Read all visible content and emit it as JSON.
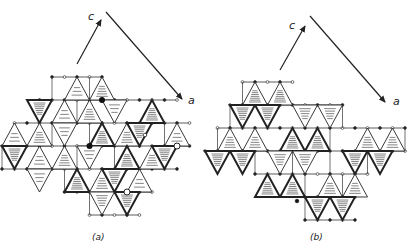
{
  "figure": {
    "panels": [
      {
        "id": "a",
        "caption": "(a)",
        "caption_pos": [
          92,
          240
        ],
        "axes": {
          "c": {
            "label": "c",
            "from": [
              77,
              64
            ],
            "to": [
              101,
              20
            ],
            "label_pos": [
              88,
              20
            ]
          },
          "a": {
            "label": "a",
            "from": [
              106,
              12
            ],
            "to": [
              182,
              99
            ],
            "label_pos": [
              188,
              104
            ]
          }
        },
        "origin": [
          52,
          77
        ],
        "dx": 12.5,
        "dy": 23,
        "triangles": [
          [
            2,
            0,
            "up",
            "light",
            false
          ],
          [
            4,
            0,
            "up",
            "stripe",
            false
          ],
          [
            -1,
            1,
            "down",
            "dense",
            true
          ],
          [
            1,
            1,
            "up",
            "light",
            false
          ],
          [
            3,
            1,
            "up",
            "stripe",
            false
          ],
          [
            5,
            1,
            "down",
            "light",
            false
          ],
          [
            8,
            1,
            "up",
            "dense",
            true
          ],
          [
            -3,
            2,
            "up",
            "light",
            false
          ],
          [
            -1,
            2,
            "up",
            "stripe",
            false
          ],
          [
            1,
            2,
            "down",
            "light",
            false
          ],
          [
            4,
            2,
            "up",
            "dense",
            true
          ],
          [
            6,
            2,
            "up",
            "stripe",
            false
          ],
          [
            7,
            2,
            "down",
            "dense",
            true
          ],
          [
            10,
            2,
            "up",
            "light",
            false
          ],
          [
            -3,
            3,
            "down",
            "dense",
            true
          ],
          [
            -1,
            3,
            "up",
            "light",
            false
          ],
          [
            1,
            3,
            "up",
            "stripe",
            false
          ],
          [
            3,
            3,
            "down",
            "light",
            false
          ],
          [
            6,
            3,
            "up",
            "dense",
            true
          ],
          [
            8,
            3,
            "up",
            "stripe",
            false
          ],
          [
            9,
            3,
            "down",
            "dense",
            true
          ],
          [
            -1,
            4,
            "down",
            "light",
            false
          ],
          [
            2,
            4,
            "up",
            "dense",
            true
          ],
          [
            4,
            4,
            "up",
            "stripe",
            false
          ],
          [
            5,
            4,
            "down",
            "dense",
            true
          ],
          [
            7,
            4,
            "up",
            "light",
            false
          ],
          [
            4,
            5,
            "down",
            "stripe",
            false
          ],
          [
            6,
            5,
            "down",
            "dense",
            true
          ]
        ],
        "rect_rows": [
          {
            "row": 0,
            "x0": 0,
            "x1": 4
          },
          {
            "row": 1,
            "x0": -1,
            "x1": 10
          },
          {
            "row": 2,
            "x0": -3,
            "x1": 11
          },
          {
            "row": 3,
            "x0": -4,
            "x1": 11
          },
          {
            "row": 4,
            "x0": -4,
            "x1": 10
          },
          {
            "row": 5,
            "x0": 1,
            "x1": 8
          },
          {
            "row": 6,
            "x0": 3,
            "x1": 7
          }
        ],
        "big_nodes": [
          [
            4,
            1
          ],
          [
            3,
            3
          ],
          [
            10,
            3
          ]
        ],
        "open_big_nodes": [
          [
            10,
            3
          ],
          [
            6,
            5
          ]
        ]
      },
      {
        "id": "b",
        "caption": "(b)",
        "caption_pos": [
          310,
          240
        ],
        "axes": {
          "c": {
            "label": "c",
            "from": [
              280,
              70
            ],
            "to": [
              305,
              26
            ],
            "label_pos": [
              289,
              29
            ]
          },
          "a": {
            "label": "a",
            "from": [
              310,
              16
            ],
            "to": [
              385,
              102
            ],
            "label_pos": [
              393,
              105
            ]
          }
        },
        "origin": [
          255,
          82
        ],
        "dx": 12.5,
        "dy": 23,
        "triangles": [
          [
            0,
            0,
            "up",
            "dense",
            false
          ],
          [
            2,
            0,
            "up",
            "dense",
            false
          ],
          [
            -1,
            1,
            "down",
            "dense",
            true
          ],
          [
            1,
            1,
            "down",
            "dense",
            true
          ],
          [
            4,
            1,
            "down",
            "stripe",
            false
          ],
          [
            6,
            1,
            "down",
            "stripe",
            false
          ],
          [
            -2,
            2,
            "up",
            "stripe",
            false
          ],
          [
            0,
            2,
            "up",
            "stripe",
            false
          ],
          [
            3,
            2,
            "up",
            "dense",
            true
          ],
          [
            5,
            2,
            "up",
            "dense",
            true
          ],
          [
            9,
            2,
            "up",
            "stripe",
            false
          ],
          [
            11,
            2,
            "up",
            "stripe",
            false
          ],
          [
            -3,
            3,
            "down",
            "dense",
            true
          ],
          [
            -1,
            3,
            "down",
            "dense",
            true
          ],
          [
            2,
            3,
            "down",
            "stripe",
            false
          ],
          [
            4,
            3,
            "down",
            "stripe",
            false
          ],
          [
            8,
            3,
            "down",
            "dense",
            true
          ],
          [
            10,
            3,
            "down",
            "dense",
            true
          ],
          [
            1,
            4,
            "up",
            "dense",
            true
          ],
          [
            3,
            4,
            "up",
            "dense",
            true
          ],
          [
            6,
            4,
            "up",
            "stripe",
            false
          ],
          [
            8,
            4,
            "up",
            "stripe",
            false
          ],
          [
            5,
            5,
            "down",
            "dense",
            true
          ],
          [
            7,
            5,
            "down",
            "dense",
            true
          ]
        ],
        "rect_rows": [
          {
            "row": 0,
            "x0": -1,
            "x1": 3
          },
          {
            "row": 1,
            "x0": -2,
            "x1": 7
          },
          {
            "row": 2,
            "x0": -3,
            "x1": 12
          },
          {
            "row": 3,
            "x0": -4,
            "x1": 12
          },
          {
            "row": 4,
            "x0": 0,
            "x1": 9
          },
          {
            "row": 5,
            "x0": 4,
            "x1": 8
          },
          {
            "row": 6,
            "x0": 4,
            "x1": 8
          }
        ],
        "stray_nodes": [
          [
            145,
            135,
            "open"
          ],
          [
            297,
            201,
            "filled"
          ]
        ]
      }
    ]
  }
}
